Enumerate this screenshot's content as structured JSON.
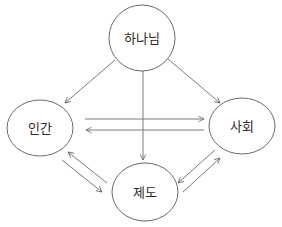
{
  "diagram": {
    "colors": {
      "background": "#ffffff",
      "node_stroke": "#6a6a6a",
      "edge_stroke": "#7a7a7a",
      "text": "#2a2a2a"
    },
    "nodes": {
      "god": {
        "label": "하나님",
        "cx": 142,
        "cy": 38,
        "rx": 33,
        "ry": 33
      },
      "human": {
        "label": "인간",
        "cx": 40,
        "cy": 128,
        "rx": 33,
        "ry": 28
      },
      "society": {
        "label": "사회",
        "cx": 242,
        "cy": 126,
        "rx": 33,
        "ry": 28
      },
      "institution": {
        "label": "제도",
        "cx": 145,
        "cy": 192,
        "rx": 33,
        "ry": 29
      }
    },
    "edges": [
      {
        "id": "god-to-human",
        "from": "하나님",
        "to": "인간",
        "x1": 115,
        "y1": 60,
        "x2": 65,
        "y2": 103
      },
      {
        "id": "god-to-society",
        "from": "하나님",
        "to": "사회",
        "x1": 168,
        "y1": 59,
        "x2": 220,
        "y2": 103
      },
      {
        "id": "god-to-institution",
        "from": "하나님",
        "to": "제도",
        "x1": 143,
        "y1": 67,
        "x2": 143,
        "y2": 160
      },
      {
        "id": "human-to-society",
        "from": "인간",
        "to": "사회",
        "x1": 85,
        "y1": 119,
        "x2": 204,
        "y2": 119
      },
      {
        "id": "society-to-human",
        "from": "사회",
        "to": "인간",
        "x1": 204,
        "y1": 130,
        "x2": 86,
        "y2": 130
      },
      {
        "id": "institution-to-human",
        "from": "제도",
        "to": "인간",
        "x1": 107,
        "y1": 183,
        "x2": 68,
        "y2": 152
      },
      {
        "id": "human-to-institution",
        "from": "인간",
        "to": "제도",
        "x1": 62,
        "y1": 160,
        "x2": 102,
        "y2": 192
      },
      {
        "id": "society-to-institution",
        "from": "사회",
        "to": "제도",
        "x1": 215,
        "y1": 150,
        "x2": 178,
        "y2": 183
      },
      {
        "id": "institution-to-society",
        "from": "제도",
        "to": "사회",
        "x1": 183,
        "y1": 192,
        "x2": 220,
        "y2": 158
      }
    ]
  }
}
